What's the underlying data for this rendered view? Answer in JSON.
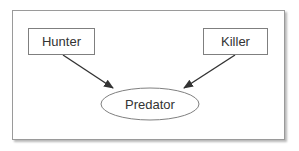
{
  "diagram": {
    "nodes": [
      {
        "id": "hunter",
        "label": "Hunter",
        "shape": "rectangle"
      },
      {
        "id": "killer",
        "label": "Killer",
        "shape": "rectangle"
      },
      {
        "id": "predator",
        "label": "Predator",
        "shape": "ellipse"
      }
    ],
    "edges": [
      {
        "from": "hunter",
        "to": "predator",
        "type": "arrow"
      },
      {
        "from": "killer",
        "to": "predator",
        "type": "arrow"
      }
    ],
    "colors": {
      "frame_border": "#9a9a9a",
      "node_border": "#7f7f7f",
      "arrow": "#333333",
      "text": "#333333",
      "background": "#ffffff"
    }
  }
}
